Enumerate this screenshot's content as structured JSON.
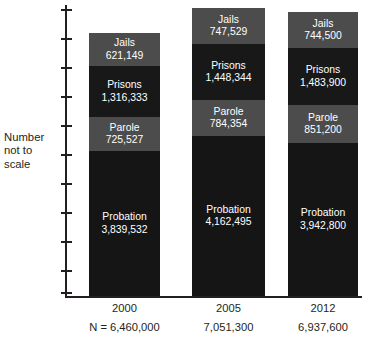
{
  "chart_data": {
    "type": "bar",
    "title": "",
    "subtitle": "",
    "xlabel": "",
    "ylabel": "Number not to scale",
    "ylabel_lines": [
      "Number",
      "not to",
      "scale"
    ],
    "stacked": true,
    "grid": false,
    "legend": "none (series labeled in-place on each segment)",
    "axis_note": "y-axis shows unlabeled tick marks only; values not to scale",
    "tick_count": 11,
    "categories": [
      "2000",
      "2005",
      "2012"
    ],
    "series": [
      {
        "name": "Jails",
        "values": [
          621149,
          747529,
          744500
        ],
        "color": "#4c4c4c"
      },
      {
        "name": "Prisons",
        "values": [
          1316333,
          1448344,
          1483900
        ],
        "color": "#181818"
      },
      {
        "name": "Parole",
        "values": [
          725527,
          784354,
          851200
        ],
        "color": "#4c4c4c"
      },
      {
        "name": "Probation",
        "values": [
          3839532,
          4162495,
          3942800
        ],
        "color": "#151515"
      }
    ],
    "totals": {
      "label_prefix": "N = ",
      "values": [
        6460000,
        7051300,
        6937600
      ],
      "display": [
        "N = 6,460,000",
        "7,051,300",
        "6,937,600"
      ]
    }
  },
  "bars": [
    {
      "year": "2000",
      "total_label": "N = 6,460,000",
      "left": 89,
      "width": 71,
      "top": 33,
      "bottom": 296,
      "segments": [
        {
          "label": "Jails",
          "value": "621,149",
          "height": 33,
          "tone": "jails"
        },
        {
          "label": "Prisons",
          "value": "1,316,333",
          "height": 51,
          "tone": "prisons"
        },
        {
          "label": "Parole",
          "value": "725,527",
          "height": 34,
          "tone": "parole"
        },
        {
          "label": "Probation",
          "value": "3,839,532",
          "height": 145,
          "tone": "probation"
        }
      ]
    },
    {
      "year": "2005",
      "total_label": "7,051,300",
      "left": 192,
      "width": 73,
      "top": 8,
      "bottom": 296,
      "segments": [
        {
          "label": "Jails",
          "value": "747,529",
          "height": 36,
          "tone": "jails"
        },
        {
          "label": "Prisons",
          "value": "1,448,344",
          "height": 56,
          "tone": "prisons"
        },
        {
          "label": "Parole",
          "value": "784,354",
          "height": 36,
          "tone": "parole"
        },
        {
          "label": "Probation",
          "value": "4,162,495",
          "height": 160,
          "tone": "probation"
        }
      ]
    },
    {
      "year": "2012",
      "total_label": "6,937,600",
      "left": 288,
      "width": 70,
      "top": 12,
      "bottom": 296,
      "segments": [
        {
          "label": "Jails",
          "value": "744,500",
          "height": 36,
          "tone": "jails"
        },
        {
          "label": "Prisons",
          "value": "1,483,900",
          "height": 57,
          "tone": "prisons"
        },
        {
          "label": "Parole",
          "value": "851,200",
          "height": 38,
          "tone": "parole"
        },
        {
          "label": "Probation",
          "value": "3,942,800",
          "height": 153,
          "tone": "probation"
        }
      ]
    }
  ],
  "axis": {
    "caption_lines": [
      "Number",
      "not to",
      "scale"
    ],
    "ticks_y": [
      9,
      38,
      67,
      96,
      125,
      154,
      183,
      212,
      241,
      270,
      292
    ]
  },
  "colors": {
    "ink": "#231f20",
    "gray_segment": "#4c4c4c",
    "dark_segment": "#181818",
    "darkest_segment": "#151515",
    "background": "#ffffff",
    "segment_text": "#ffffff"
  }
}
